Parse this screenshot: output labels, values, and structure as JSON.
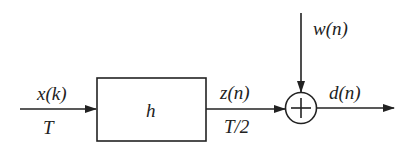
{
  "diagram": {
    "type": "block-diagram",
    "input": {
      "signal": "x(k)",
      "rate": "T"
    },
    "block": {
      "label": "h"
    },
    "intermediate": {
      "signal": "z(n)",
      "rate": "T/2"
    },
    "noise": {
      "signal": "w(n)"
    },
    "summer": {
      "symbol": "+"
    },
    "output": {
      "signal": "d(n)"
    }
  },
  "colors": {
    "stroke": "#222222",
    "background": "#ffffff"
  }
}
